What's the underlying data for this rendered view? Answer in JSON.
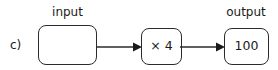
{
  "diagram": {
    "item_letter": "c)",
    "labels": {
      "input": "input",
      "output": "output"
    },
    "nodes": [
      {
        "id": "input",
        "value": "",
        "label": "input"
      },
      {
        "id": "operation",
        "value": "× 4"
      },
      {
        "id": "output",
        "value": "100",
        "label": "output"
      }
    ],
    "connectors": [
      {
        "from": "input",
        "to": "operation",
        "arrow": "arrow-right-icon"
      },
      {
        "from": "operation",
        "to": "output",
        "arrow": "arrow-right-icon"
      }
    ],
    "colors": {
      "stroke": "#2b2b2b",
      "text": "#1a1a1a",
      "background": "#ffffff"
    }
  }
}
